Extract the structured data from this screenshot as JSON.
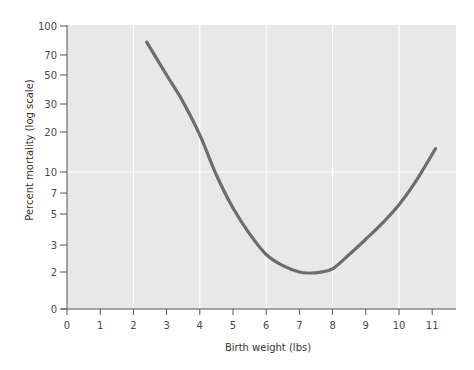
{
  "chart_data": {
    "type": "line",
    "title": "",
    "xlabel": "Birth weight (lbs)",
    "ylabel": "Percent mortality (log scale)",
    "xlim": [
      0,
      11.7
    ],
    "ylim": [
      0,
      100
    ],
    "yscale": "log",
    "x_ticks": [
      0,
      1,
      2,
      3,
      4,
      5,
      6,
      7,
      8,
      9,
      10,
      11
    ],
    "x_tick_labels": [
      "0",
      "1",
      "2",
      "3",
      "4",
      "5",
      "6",
      "7",
      "8",
      "9",
      "10",
      "11"
    ],
    "y_ticks": [
      0,
      2,
      3,
      5,
      7,
      10,
      20,
      30,
      50,
      70,
      100
    ],
    "y_tick_labels": [
      "0",
      "2",
      "3",
      "5",
      "7",
      "10",
      "20",
      "30",
      "50",
      "70",
      "100"
    ],
    "grid": {
      "x": [
        2,
        4,
        6,
        8,
        10
      ],
      "y": [
        10
      ]
    },
    "legend": "none",
    "series": [
      {
        "name": "Mortality",
        "x": [
          2.4,
          3.0,
          3.5,
          4.0,
          4.5,
          5.0,
          5.5,
          6.0,
          6.5,
          7.0,
          7.3,
          7.6,
          8.0,
          8.5,
          9.0,
          9.5,
          10.0,
          10.5,
          11.1
        ],
        "y": [
          82,
          50,
          31,
          19,
          9.5,
          5.5,
          3.6,
          2.6,
          2.2,
          2.0,
          1.97,
          1.99,
          2.1,
          2.6,
          3.3,
          4.3,
          5.8,
          8.5,
          15
        ]
      }
    ],
    "colors": {
      "plot_background": "#e8e8e8",
      "gridline": "#ffffff",
      "curve": "#6d6d6d",
      "axis": "#555555"
    }
  }
}
